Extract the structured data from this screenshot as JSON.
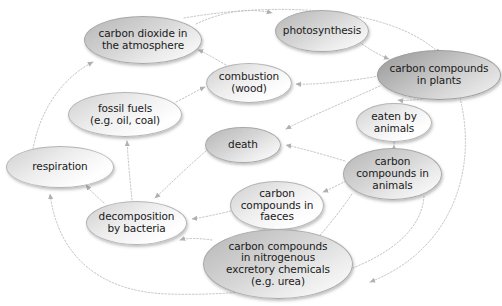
{
  "diagram": {
    "type": "concept-map",
    "width": 502,
    "height": 306,
    "background_color": "#ffffff",
    "edge_color": "#b9b9b9",
    "node_text_color": "#1a1a1a",
    "nodes": [
      {
        "id": "carbon-dioxide-atmosphere",
        "label": "carbon dioxide in\nthe atmosphere",
        "x": 84,
        "y": 16,
        "w": 118,
        "h": 48,
        "font_size": 10.5,
        "shade": "mid"
      },
      {
        "id": "photosynthesis",
        "label": "photosynthesis",
        "x": 275,
        "y": 10,
        "w": 94,
        "h": 42,
        "font_size": 10.5,
        "shade": "mid"
      },
      {
        "id": "carbon-compounds-plants",
        "label": "carbon compounds\nin plants",
        "x": 377,
        "y": 50,
        "w": 124,
        "h": 50,
        "font_size": 10.5,
        "shade": "dark"
      },
      {
        "id": "combustion-wood",
        "label": "combustion\n(wood)",
        "x": 206,
        "y": 63,
        "w": 86,
        "h": 40,
        "font_size": 10.5,
        "shade": "light"
      },
      {
        "id": "fossil-fuels",
        "label": "fossil fuels\n(e.g. oil, coal)",
        "x": 68,
        "y": 92,
        "w": 114,
        "h": 45,
        "font_size": 10.5,
        "shade": "light"
      },
      {
        "id": "eaten-by-animals",
        "label": "eaten by\nanimals",
        "x": 356,
        "y": 103,
        "w": 76,
        "h": 39,
        "font_size": 10.5,
        "shade": "light"
      },
      {
        "id": "death",
        "label": "death",
        "x": 205,
        "y": 127,
        "w": 76,
        "h": 36,
        "font_size": 10.5,
        "shade": "mid"
      },
      {
        "id": "respiration",
        "label": "respiration",
        "x": 6,
        "y": 146,
        "w": 108,
        "h": 42,
        "font_size": 10.5,
        "shade": "light"
      },
      {
        "id": "carbon-compounds-animals",
        "label": "carbon\ncompounds in\nanimals",
        "x": 343,
        "y": 148,
        "w": 99,
        "h": 52,
        "font_size": 10.5,
        "shade": "mid"
      },
      {
        "id": "carbon-compounds-faeces",
        "label": "carbon\ncompounds in\nfaeces",
        "x": 230,
        "y": 181,
        "w": 94,
        "h": 49,
        "font_size": 10.5,
        "shade": "light"
      },
      {
        "id": "decomposition-by-bacteria",
        "label": "decomposition\nby bacteria",
        "x": 86,
        "y": 201,
        "w": 101,
        "h": 44,
        "font_size": 10.5,
        "shade": "light"
      },
      {
        "id": "carbon-compounds-nitrogenous",
        "label": "carbon compounds\nin nitrogenous\nexcretory chemicals\n(e.g. urea)",
        "x": 203,
        "y": 229,
        "w": 150,
        "h": 70,
        "font_size": 10.5,
        "shade": "mid"
      }
    ],
    "edges": [
      {
        "id": "edge-co2-photosynthesis",
        "from": "carbon-dioxide-atmosphere",
        "to": "photosynthesis"
      },
      {
        "id": "edge-photosynthesis-plants",
        "from": "photosynthesis",
        "to": "carbon-compounds-plants"
      },
      {
        "id": "edge-plants-combustion",
        "from": "carbon-compounds-plants",
        "to": "combustion-wood"
      },
      {
        "id": "edge-combustion-co2",
        "from": "combustion-wood",
        "to": "carbon-dioxide-atmosphere"
      },
      {
        "id": "edge-fossilfuels-combustion",
        "from": "fossil-fuels",
        "to": "combustion-wood"
      },
      {
        "id": "edge-plants-eaten",
        "from": "carbon-compounds-plants",
        "to": "eaten-by-animals"
      },
      {
        "id": "edge-eaten-animals",
        "from": "eaten-by-animals",
        "to": "carbon-compounds-animals"
      },
      {
        "id": "edge-plants-death",
        "from": "carbon-compounds-plants",
        "to": "death"
      },
      {
        "id": "edge-animals-death",
        "from": "carbon-compounds-animals",
        "to": "death"
      },
      {
        "id": "edge-animals-faeces",
        "from": "carbon-compounds-animals",
        "to": "carbon-compounds-faeces"
      },
      {
        "id": "edge-animals-nitrogenous",
        "from": "carbon-compounds-animals",
        "to": "carbon-compounds-nitrogenous"
      },
      {
        "id": "edge-death-decomposition",
        "from": "death",
        "to": "decomposition-by-bacteria"
      },
      {
        "id": "edge-faeces-decomposition",
        "from": "carbon-compounds-faeces",
        "to": "decomposition-by-bacteria"
      },
      {
        "id": "edge-nitrogenous-decomposition",
        "from": "carbon-compounds-nitrogenous",
        "to": "decomposition-by-bacteria"
      },
      {
        "id": "edge-decomposition-respiration",
        "from": "decomposition-by-bacteria",
        "to": "respiration"
      },
      {
        "id": "edge-respiration-co2",
        "from": "respiration",
        "to": "carbon-dioxide-atmosphere"
      },
      {
        "id": "edge-decomposition-fossilfuels",
        "from": "decomposition-by-bacteria",
        "to": "fossil-fuels"
      },
      {
        "id": "edge-animals-respiration-outer",
        "from": "carbon-compounds-animals",
        "to": "respiration"
      },
      {
        "id": "edge-plants-respiration-outer",
        "from": "carbon-compounds-plants",
        "to": "respiration"
      }
    ]
  }
}
